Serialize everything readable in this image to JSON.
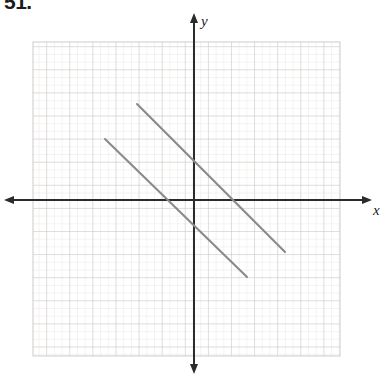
{
  "figure": {
    "problem_number": "51.",
    "axis_labels": {
      "x": "x",
      "y": "y"
    },
    "colors": {
      "background": "#ffffff",
      "minor_grid": "#dfdcd8",
      "major_grid": "#c8c4bf",
      "axis": "#2b2b2b",
      "line_stroke": "#8a8a8a",
      "text": "#1a1a1a"
    }
  },
  "chart_data": {
    "type": "line",
    "title": "",
    "subtitle": "",
    "xlabel": "x",
    "ylabel": "y",
    "grid": true,
    "legend": "none",
    "annotations": [
      "51."
    ],
    "axis_style": {
      "x_axis_arrows": "both",
      "y_axis_arrows": "both",
      "tick_labels": "none",
      "origin_px": [
        194,
        200
      ],
      "cell_size_px": 7.7,
      "major_every_cells": 3
    },
    "grid_extent_px": {
      "left": 33,
      "top": 42,
      "right": 340,
      "bottom": 356
    },
    "xlim": [
      -21,
      19
    ],
    "ylim": [
      -20,
      20
    ],
    "series": [
      {
        "name": "segment-upper",
        "slope": -1,
        "points_px": [
          [
            137,
            104
          ],
          [
            285,
            252
          ]
        ],
        "points_units": [
          [
            -7.4,
            12.5
          ],
          [
            11.8,
            -6.8
          ]
        ]
      },
      {
        "name": "segment-lower",
        "slope": -1,
        "points_px": [
          [
            105,
            139
          ],
          [
            247,
            277
          ]
        ],
        "points_units": [
          [
            -11.6,
            7.9
          ],
          [
            6.9,
            -10.0
          ]
        ]
      }
    ]
  }
}
